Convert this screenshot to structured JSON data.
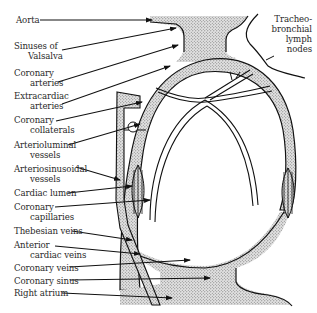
{
  "diagram": {
    "type": "anatomical-schematic",
    "fill_color": "#cfcfcf",
    "line_color": "#111111",
    "left_labels": [
      {
        "id": "aorta",
        "line1": "Aorta",
        "line2": ""
      },
      {
        "id": "sinuses",
        "line1": "Sinuses of",
        "line2": "Valsalva"
      },
      {
        "id": "coronary-arteries",
        "line1": "Coronary",
        "line2": "arteries"
      },
      {
        "id": "extracardiac",
        "line1": "Extracardiac",
        "line2": "arteries"
      },
      {
        "id": "collaterals",
        "line1": "Coronary",
        "line2": "collaterals"
      },
      {
        "id": "arterioluminal",
        "line1": "Arterioluminal",
        "line2": "vessels"
      },
      {
        "id": "arteriosinusoidal",
        "line1": "Arteriosinusoidal",
        "line2": "vessels"
      },
      {
        "id": "cardiac-lumen",
        "line1": "Cardiac lumen",
        "line2": ""
      },
      {
        "id": "capillaries",
        "line1": "Coronary",
        "line2": "capillaries"
      },
      {
        "id": "thebesian",
        "line1": "Thebesian veins",
        "line2": ""
      },
      {
        "id": "anterior-cardiac",
        "line1": "Anterior",
        "line2": "cardiac veins"
      },
      {
        "id": "coronary-veins",
        "line1": "Coronary veins",
        "line2": ""
      },
      {
        "id": "coronary-sinus",
        "line1": "Coronary sinus",
        "line2": ""
      },
      {
        "id": "right-atrium",
        "line1": "Right atrium",
        "line2": ""
      }
    ],
    "right_label": {
      "id": "lymph",
      "lines": [
        "Tracheo-",
        "bronchial",
        "lymph",
        "nodes"
      ]
    }
  }
}
